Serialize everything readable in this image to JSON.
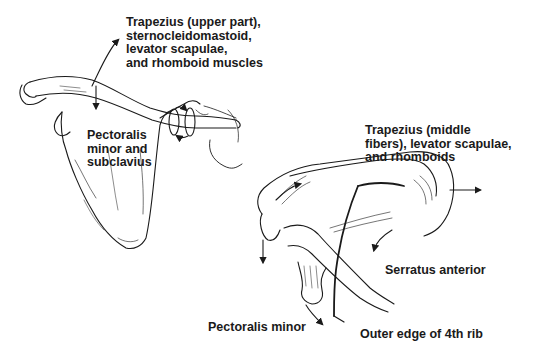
{
  "diagram": {
    "line_color": "#1a1a1a",
    "background": "#ffffff",
    "labels": {
      "trapezius_upper": "Trapezius (upper part),\nsternocleidomastoid,\nlevator scapulae,\nand rhomboid muscles",
      "pectoralis_subclavius": "Pectoralis\nminor and\nsubclavius",
      "trapezius_middle": "Trapezius (middle\nfibers), levator scapulae,\nand rhomboids",
      "serratus_anterior": "Serratus anterior",
      "pectoralis_minor": "Pectoralis minor",
      "outer_edge_rib": "Outer edge of 4th rib"
    },
    "figures": [
      {
        "name": "anterior-view",
        "parts": [
          "scapula",
          "clavicle"
        ]
      },
      {
        "name": "lateral-view",
        "parts": [
          "scapula",
          "clavicle",
          "coracoid",
          "4th rib"
        ]
      }
    ]
  }
}
